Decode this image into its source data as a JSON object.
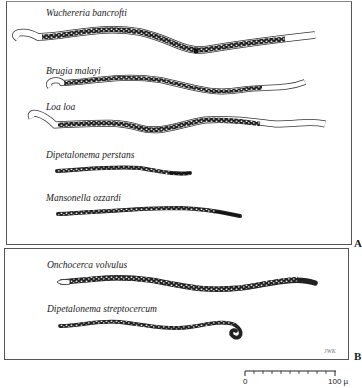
{
  "figure": {
    "panels": [
      {
        "letter": "A",
        "species": [
          {
            "name": "Wuchereria bancrofti"
          },
          {
            "name": "Brugia malayi"
          },
          {
            "name": "Loa loa"
          },
          {
            "name": "Dipetalonema perstans"
          },
          {
            "name": "Mansonella ozzardi"
          }
        ]
      },
      {
        "letter": "B",
        "species": [
          {
            "name": "Onchocerca volvulus"
          },
          {
            "name": "Dipetalonema streptocercum"
          }
        ]
      }
    ],
    "scale_bar": {
      "start": "0",
      "end": "100 µ"
    },
    "signature": "JWK"
  },
  "colors": {
    "ink": "#1a1a1a",
    "border": "#555555",
    "background": "#ffffff"
  }
}
